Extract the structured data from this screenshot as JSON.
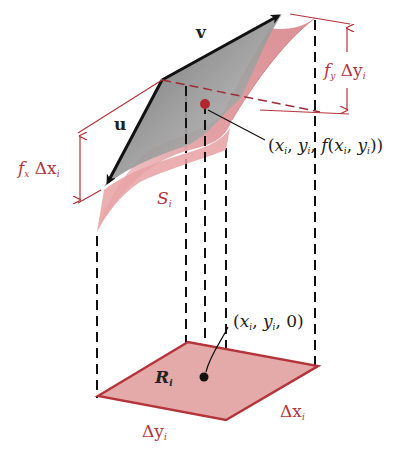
{
  "colors": {
    "accent_red": "#b5343c",
    "surface_pink": "#e8a3a6",
    "base_fill": "#dfa5a5",
    "tangent_gray": "#8d8d8d",
    "ink": "#111111"
  },
  "labels": {
    "v": "v",
    "u": "u",
    "fy_f": "f",
    "fy_sub": "y",
    "fy_delta": "Δy",
    "fy_delta_sub": "i",
    "fx_f": "f",
    "fx_sub": "x",
    "fx_delta": "Δx",
    "fx_delta_sub": "i",
    "surface_S": "S",
    "surface_S_sub": "i",
    "point_on_surface": "(x",
    "point_on_surface_full": "(xᵢ, yᵢ, f(xᵢ, yᵢ))",
    "pos_open": "(",
    "pos_x": "x",
    "pos_comma1": ", ",
    "pos_y": "y",
    "pos_comma2": ", ",
    "pos_f": "f",
    "pos_inner_open": "(",
    "pos_inner_x": "x",
    "pos_inner_comma": ", ",
    "pos_inner_y": "y",
    "pos_close": "))",
    "sub_i": "i",
    "base_point_open": "(",
    "base_point_x": "x",
    "base_point_y": "y",
    "base_point_zero": "0)",
    "region_R": "R",
    "region_R_sub": "i",
    "base_dy": "Δy",
    "base_dy_sub": "i",
    "base_dx": "Δx",
    "base_dx_sub": "i"
  }
}
